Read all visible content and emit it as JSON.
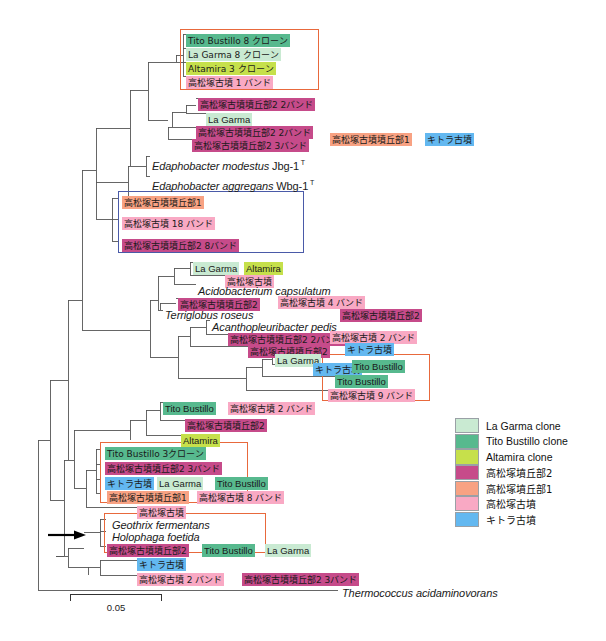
{
  "figure": {
    "type": "phylogenetic-tree",
    "outgroup": "Thermococcus acidaminovorans",
    "scale_bar": {
      "value": "0.05",
      "length_px": 92
    },
    "arrow_marker": "black-arrow-pointing-to-geothrix-holophaga-clade"
  },
  "legend": {
    "items": [
      {
        "label": "La Garma clone",
        "color": "#c9ead2",
        "key": "lagarma"
      },
      {
        "label": "Tito Bustillo clone",
        "color": "#57b98e",
        "key": "tito"
      },
      {
        "label": "Altamira clone",
        "color": "#c6e04b",
        "key": "altamira"
      },
      {
        "label": "高松塚墳丘部2",
        "color": "#c64b8a",
        "key": "tak2"
      },
      {
        "label": "高松塚墳丘部1",
        "color": "#f8a283",
        "key": "tak1"
      },
      {
        "label": "高松塚古墳",
        "color": "#f9a9c4",
        "key": "takkofun"
      },
      {
        "label": "キトラ古墳",
        "color": "#63b8f0",
        "key": "kitora"
      }
    ]
  },
  "labels": [
    {
      "id": "l01",
      "text": "Tito Bustillo 8 クローン",
      "color": "tito",
      "x": 186,
      "y": 34,
      "jp": true
    },
    {
      "id": "l02",
      "text": "La Garma 8 クローン",
      "color": "lagarma",
      "x": 186,
      "y": 48,
      "jp": true
    },
    {
      "id": "l03",
      "text": "Altamira 3 クローン",
      "color": "altamira",
      "x": 186,
      "y": 62,
      "jp": true
    },
    {
      "id": "l04",
      "text": "高松塚古墳 1 バンド",
      "color": "takkofun",
      "x": 186,
      "y": 76,
      "jp": true
    },
    {
      "id": "l05",
      "text": "高松塚古墳墳丘部2  2バンド",
      "color": "tak2",
      "x": 198,
      "y": 98,
      "jp": true
    },
    {
      "id": "l06",
      "text": "La Garma",
      "color": "lagarma",
      "x": 206,
      "y": 113,
      "jp": false
    },
    {
      "id": "l07",
      "text": "高松塚古墳墳丘部2  2バンド",
      "color": "tak2",
      "x": 196,
      "y": 126,
      "jp": true
    },
    {
      "id": "l08",
      "text": "高松塚古墳墳丘部2  3バンド",
      "color": "tak2",
      "x": 192,
      "y": 139,
      "jp": true
    },
    {
      "id": "l09",
      "text": "高松塚古墳墳丘部1",
      "color": "tak1",
      "x": 330,
      "y": 133,
      "jp": true
    },
    {
      "id": "l10",
      "text": "キトラ古墳",
      "color": "kitora",
      "x": 425,
      "y": 133,
      "jp": true
    },
    {
      "id": "l11",
      "text": "高松塚古墳墳丘部1",
      "color": "tak1",
      "x": 122,
      "y": 196,
      "jp": true
    },
    {
      "id": "l12",
      "text": "高松塚古墳 18 バンド",
      "color": "takkofun",
      "x": 122,
      "y": 217,
      "jp": true
    },
    {
      "id": "l13",
      "text": "高松塚古墳墳丘部2  8バンド",
      "color": "tak2",
      "x": 122,
      "y": 239,
      "jp": true
    },
    {
      "id": "l14",
      "text": "La Garma",
      "color": "lagarma",
      "x": 193,
      "y": 262,
      "jp": false
    },
    {
      "id": "l15",
      "text": "Altamira",
      "color": "altamira",
      "x": 244,
      "y": 262,
      "jp": false
    },
    {
      "id": "l16",
      "text": "高松塚古墳",
      "color": "takkofun",
      "x": 225,
      "y": 275,
      "jp": true
    },
    {
      "id": "l17",
      "text": "高松塚古墳墳丘部2",
      "color": "tak2",
      "x": 178,
      "y": 298,
      "jp": true
    },
    {
      "id": "l18",
      "text": "高松塚古墳 4 バンド",
      "color": "takkofun",
      "x": 278,
      "y": 296,
      "jp": true
    },
    {
      "id": "l19",
      "text": "高松塚古墳墳丘部2",
      "color": "tak2",
      "x": 340,
      "y": 309,
      "jp": true
    },
    {
      "id": "l20",
      "text": "高松塚古墳墳丘部2  2バンド",
      "color": "tak2",
      "x": 228,
      "y": 333,
      "jp": true
    },
    {
      "id": "l21",
      "text": "高松塚古墳 2 バンド",
      "color": "takkofun",
      "x": 330,
      "y": 331,
      "jp": true
    },
    {
      "id": "l22",
      "text": "高松塚古墳墳丘部2",
      "color": "tak2",
      "x": 248,
      "y": 345,
      "jp": true
    },
    {
      "id": "l23",
      "text": "キトラ古墳",
      "color": "kitora",
      "x": 345,
      "y": 343,
      "jp": true
    },
    {
      "id": "l24",
      "text": "La Garma",
      "color": "lagarma",
      "x": 275,
      "y": 354,
      "jp": false
    },
    {
      "id": "l25",
      "text": "キトラ古墳",
      "color": "kitora",
      "x": 313,
      "y": 363,
      "jp": true
    },
    {
      "id": "l26",
      "text": "Tito Bustillo",
      "color": "tito",
      "x": 352,
      "y": 360,
      "jp": false
    },
    {
      "id": "l27",
      "text": "Tito Bustillo",
      "color": "tito",
      "x": 335,
      "y": 375,
      "jp": false
    },
    {
      "id": "l28",
      "text": "高松塚古墳 9 バンド",
      "color": "takkofun",
      "x": 328,
      "y": 389,
      "jp": true
    },
    {
      "id": "l29",
      "text": "Tito Bustillo",
      "color": "tito",
      "x": 163,
      "y": 402,
      "jp": false
    },
    {
      "id": "l30",
      "text": "高松塚古墳 2 バンド",
      "color": "takkofun",
      "x": 228,
      "y": 402,
      "jp": true
    },
    {
      "id": "l31",
      "text": "高松塚古墳墳丘部2",
      "color": "tak2",
      "x": 185,
      "y": 419,
      "jp": true
    },
    {
      "id": "l32",
      "text": "Altamira",
      "color": "altamira",
      "x": 181,
      "y": 434,
      "jp": false
    },
    {
      "id": "l33",
      "text": "Tito Bustillo 3クローン",
      "color": "tito",
      "x": 105,
      "y": 447,
      "jp": true
    },
    {
      "id": "l34",
      "text": "高松塚古墳墳丘部2  3バンド",
      "color": "tak2",
      "x": 105,
      "y": 462,
      "jp": true
    },
    {
      "id": "l35",
      "text": "キトラ古墳",
      "color": "kitora",
      "x": 105,
      "y": 477,
      "jp": true
    },
    {
      "id": "l36",
      "text": "La Garma",
      "color": "lagarma",
      "x": 157,
      "y": 477,
      "jp": false
    },
    {
      "id": "l37",
      "text": "Tito Bustillo",
      "color": "tito",
      "x": 215,
      "y": 477,
      "jp": false
    },
    {
      "id": "l38",
      "text": "高松塚古墳墳丘部1",
      "color": "tak1",
      "x": 107,
      "y": 491,
      "jp": true
    },
    {
      "id": "l39",
      "text": "高松塚古墳 8 バンド",
      "color": "takkofun",
      "x": 197,
      "y": 491,
      "jp": true
    },
    {
      "id": "l40",
      "text": "高松塚古墳",
      "color": "takkofun",
      "x": 137,
      "y": 506,
      "jp": true
    },
    {
      "id": "l43",
      "text": "高松塚古墳墳丘部2",
      "color": "tak2",
      "x": 107,
      "y": 544,
      "jp": true
    },
    {
      "id": "l44",
      "text": "Tito Bustillo",
      "color": "tito",
      "x": 202,
      "y": 544,
      "jp": false
    },
    {
      "id": "l45",
      "text": "La Garma",
      "color": "lagarma",
      "x": 265,
      "y": 544,
      "jp": false
    },
    {
      "id": "l46",
      "text": "キトラ古墳",
      "color": "kitora",
      "x": 137,
      "y": 558,
      "jp": true
    },
    {
      "id": "l47",
      "text": "高松塚古墳 2 バンド",
      "color": "takkofun",
      "x": 137,
      "y": 573,
      "jp": true
    },
    {
      "id": "l48",
      "text": "高松塚古墳墳丘部2  3バンド",
      "color": "tak2",
      "x": 242,
      "y": 573,
      "jp": true
    }
  ],
  "species": [
    {
      "id": "s01",
      "name": "Edaphobacter modestus",
      "strain": "Jbg-1",
      "type": true,
      "x": 150,
      "y": 156
    },
    {
      "id": "s02",
      "name": "Edaphobacter aggregans",
      "strain": "Wbg-1",
      "type": true,
      "x": 150,
      "y": 176
    },
    {
      "id": "s03",
      "name": "Acidobacterium capsulatum",
      "strain": "",
      "type": false,
      "x": 196,
      "y": 284
    },
    {
      "id": "s04",
      "name": "Terriglobus roseus",
      "strain": "",
      "type": false,
      "x": 163,
      "y": 308
    },
    {
      "id": "s05",
      "name": "Acanthopleuribacter pedis",
      "strain": "",
      "type": false,
      "x": 210,
      "y": 320
    },
    {
      "id": "s06",
      "name": "Geothrix fermentans",
      "strain": "",
      "type": false,
      "x": 110,
      "y": 518
    },
    {
      "id": "s07",
      "name": "Holophaga foetida",
      "strain": "",
      "type": false,
      "x": 110,
      "y": 530
    },
    {
      "id": "s08",
      "name": "Thermococcus acidaminovorans",
      "strain": "",
      "type": false,
      "x": 340,
      "y": 586
    }
  ],
  "boxes": [
    {
      "id": "b1",
      "style": "orange",
      "x": 180,
      "y": 29,
      "w": 139,
      "h": 61
    },
    {
      "id": "b2",
      "style": "blue",
      "x": 118,
      "y": 191,
      "w": 186,
      "h": 62
    },
    {
      "id": "b3",
      "style": "orange",
      "x": 322,
      "y": 354,
      "w": 108,
      "h": 47
    },
    {
      "id": "b4",
      "style": "orange",
      "x": 100,
      "y": 442,
      "w": 148,
      "h": 61
    },
    {
      "id": "b5",
      "style": "orange",
      "x": 104,
      "y": 513,
      "w": 162,
      "h": 40
    }
  ]
}
